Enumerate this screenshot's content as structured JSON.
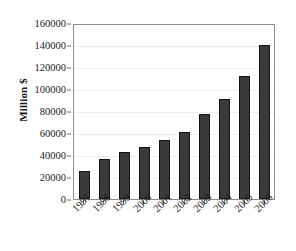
{
  "chart_data": {
    "type": "bar",
    "title": "",
    "subtitle": "",
    "xlabel": "",
    "ylabel": "Million $",
    "categories": [
      "1997",
      "1998",
      "1999",
      "2000",
      "2001",
      "2002",
      "2003",
      "2004",
      "2005",
      "2006"
    ],
    "values": [
      25500,
      36500,
      42500,
      47000,
      53500,
      61000,
      77000,
      90500,
      111500,
      140000
    ],
    "series": [
      {
        "name": "Million $",
        "values": [
          25500,
          36500,
          42500,
          47000,
          53500,
          61000,
          77000,
          90500,
          111500,
          140000
        ]
      }
    ],
    "ylim": [
      0,
      160000
    ],
    "ytick_labels": [
      "0",
      "20000",
      "40000",
      "60000",
      "80000",
      "100000",
      "120000",
      "140000",
      "160000"
    ],
    "ytick_values": [
      0,
      20000,
      40000,
      60000,
      80000,
      100000,
      120000,
      140000,
      160000
    ],
    "grid": true,
    "grid_axis": "y",
    "legend": false,
    "legend_position": "none",
    "annotations": [],
    "colors": {
      "bar_fill": "#3a3a3a",
      "bar_outline": "#121212",
      "gridline": "#ededed",
      "axis": "#8d8d8d",
      "plot_background": "#ffffff",
      "text": "#1a1a1a"
    }
  }
}
